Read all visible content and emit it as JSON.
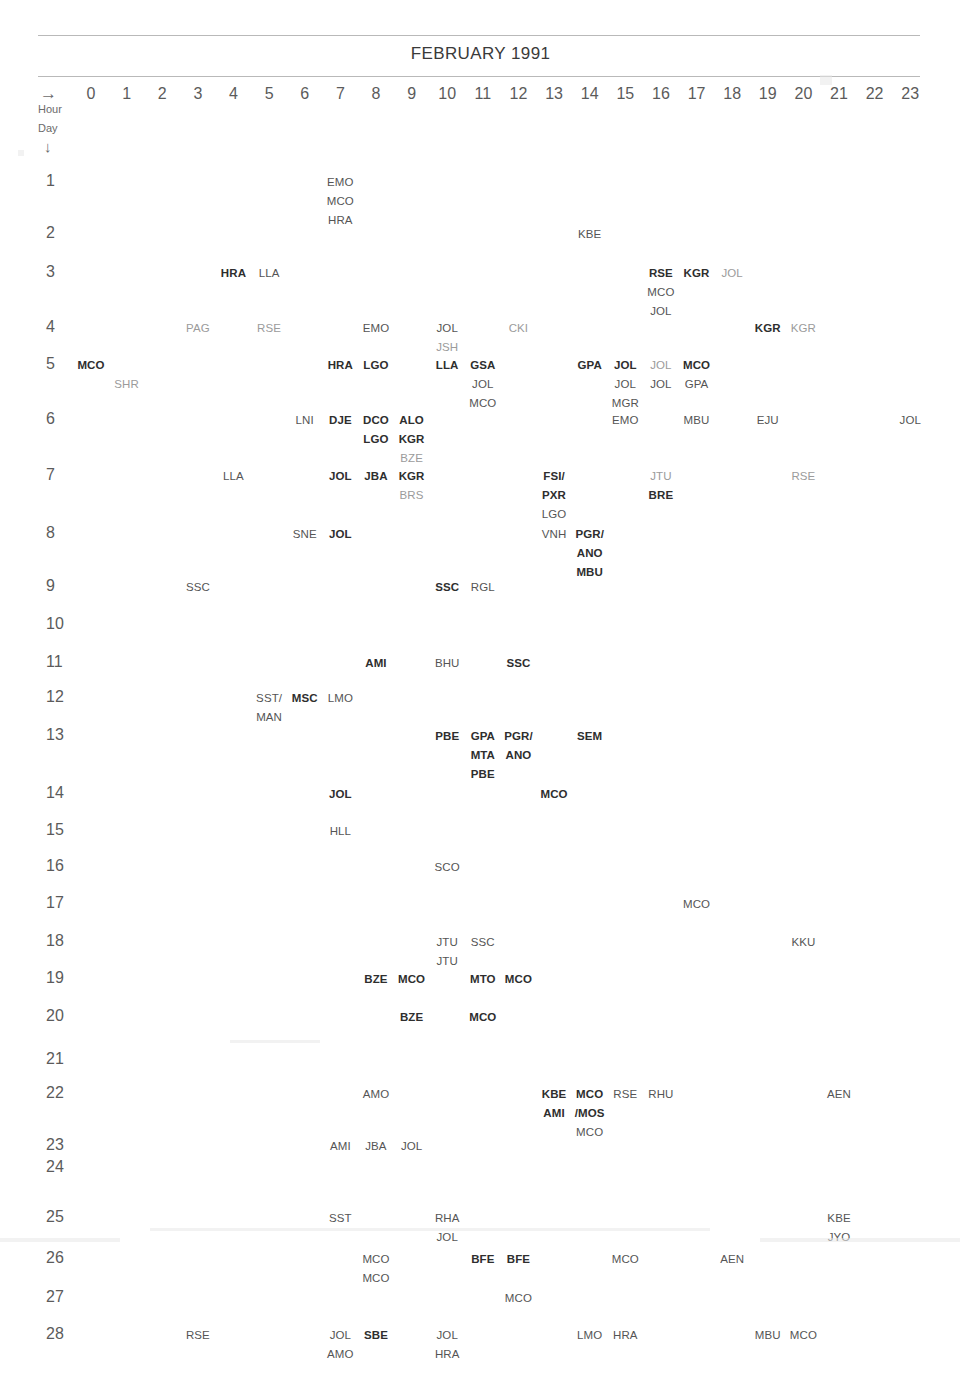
{
  "header": {
    "title": "FEBRUARY 1991",
    "hour_axis_label": "Hour",
    "day_axis_label": "Day",
    "hour_arrow": "→",
    "day_arrow": "↓",
    "hours": [
      "0",
      "1",
      "2",
      "3",
      "4",
      "5",
      "6",
      "7",
      "8",
      "9",
      "10",
      "11",
      "12",
      "13",
      "14",
      "15",
      "16",
      "17",
      "18",
      "19",
      "20",
      "21",
      "22",
      "23"
    ]
  },
  "colors": {
    "page_background": "#ffffff",
    "rule": "#b9b9b9",
    "text_dark": "#2e2e2e",
    "text_mid": "#555555",
    "text_light": "#9b9b9b",
    "axis_text": "#5b5b5b"
  },
  "chart_data": {
    "type": "table",
    "title": "FEBRUARY 1991",
    "xlabel": "Hour",
    "ylabel": "Day",
    "x": [
      0,
      1,
      2,
      3,
      4,
      5,
      6,
      7,
      8,
      9,
      10,
      11,
      12,
      13,
      14,
      15,
      16,
      17,
      18,
      19,
      20,
      21,
      22,
      23
    ],
    "xlim": [
      0,
      23
    ],
    "ylim": [
      1,
      28
    ],
    "grid": false,
    "legend": "none",
    "note": "Station-code event calendar: each day row lists three-letter codes placed at the hour column in which the event occurred; stacked codes indicate multiple events in the same hour.",
    "days": [
      {
        "day": "1",
        "entries": [
          {
            "hour": 7,
            "row": 0,
            "code": "EMO",
            "weight": "mid"
          },
          {
            "hour": 7,
            "row": 1,
            "code": "MCO",
            "weight": "mid"
          },
          {
            "hour": 7,
            "row": 2,
            "code": "HRA",
            "weight": "mid"
          }
        ]
      },
      {
        "day": "2",
        "entries": [
          {
            "hour": 14,
            "row": 0,
            "code": "KBE",
            "weight": "mid"
          }
        ]
      },
      {
        "day": "3",
        "entries": [
          {
            "hour": 4,
            "row": 0,
            "code": "HRA",
            "weight": "dark"
          },
          {
            "hour": 5,
            "row": 0,
            "code": "LLA",
            "weight": "mid"
          },
          {
            "hour": 16,
            "row": 0,
            "code": "RSE",
            "weight": "dark"
          },
          {
            "hour": 17,
            "row": 0,
            "code": "KGR",
            "weight": "dark"
          },
          {
            "hour": 18,
            "row": 0,
            "code": "JOL",
            "weight": "light"
          },
          {
            "hour": 16,
            "row": 1,
            "code": "MCO",
            "weight": "mid"
          },
          {
            "hour": 16,
            "row": 2,
            "code": "JOL",
            "weight": "mid"
          }
        ]
      },
      {
        "day": "4",
        "entries": [
          {
            "hour": 3,
            "row": 0,
            "code": "PAG",
            "weight": "light"
          },
          {
            "hour": 5,
            "row": 0,
            "code": "RSE",
            "weight": "light"
          },
          {
            "hour": 8,
            "row": 0,
            "code": "EMO",
            "weight": "mid"
          },
          {
            "hour": 10,
            "row": 0,
            "code": "JOL",
            "weight": "mid"
          },
          {
            "hour": 12,
            "row": 0,
            "code": "CKI",
            "weight": "light"
          },
          {
            "hour": 19,
            "row": 0,
            "code": "KGR",
            "weight": "dark"
          },
          {
            "hour": 20,
            "row": 0,
            "code": "KGR",
            "weight": "light"
          },
          {
            "hour": 10,
            "row": 1,
            "code": "JSH",
            "weight": "light"
          }
        ]
      },
      {
        "day": "5",
        "entries": [
          {
            "hour": 0,
            "row": 0,
            "code": "MCO",
            "weight": "dark"
          },
          {
            "hour": 7,
            "row": 0,
            "code": "HRA",
            "weight": "dark"
          },
          {
            "hour": 8,
            "row": 0,
            "code": "LGO",
            "weight": "dark"
          },
          {
            "hour": 10,
            "row": 0,
            "code": "LLA",
            "weight": "dark"
          },
          {
            "hour": 11,
            "row": 0,
            "code": "GSA",
            "weight": "dark"
          },
          {
            "hour": 14,
            "row": 0,
            "code": "GPA",
            "weight": "dark"
          },
          {
            "hour": 15,
            "row": 0,
            "code": "JOL",
            "weight": "dark"
          },
          {
            "hour": 16,
            "row": 0,
            "code": "JOL",
            "weight": "light"
          },
          {
            "hour": 17,
            "row": 0,
            "code": "MCO",
            "weight": "dark"
          },
          {
            "hour": 1,
            "row": 1,
            "code": "SHR",
            "weight": "light"
          },
          {
            "hour": 11,
            "row": 1,
            "code": "JOL",
            "weight": "mid"
          },
          {
            "hour": 15,
            "row": 1,
            "code": "JOL",
            "weight": "mid"
          },
          {
            "hour": 16,
            "row": 1,
            "code": "JOL",
            "weight": "mid"
          },
          {
            "hour": 17,
            "row": 1,
            "code": "GPA",
            "weight": "mid"
          },
          {
            "hour": 11,
            "row": 2,
            "code": "MCO",
            "weight": "mid"
          },
          {
            "hour": 15,
            "row": 2,
            "code": "MGR",
            "weight": "mid"
          }
        ]
      },
      {
        "day": "6",
        "entries": [
          {
            "hour": 6,
            "row": 0,
            "code": "LNI",
            "weight": "mid"
          },
          {
            "hour": 7,
            "row": 0,
            "code": "DJE",
            "weight": "dark"
          },
          {
            "hour": 8,
            "row": 0,
            "code": "DCO",
            "weight": "dark"
          },
          {
            "hour": 9,
            "row": 0,
            "code": "ALO",
            "weight": "dark"
          },
          {
            "hour": 15,
            "row": 0,
            "code": "EMO",
            "weight": "mid"
          },
          {
            "hour": 17,
            "row": 0,
            "code": "MBU",
            "weight": "mid"
          },
          {
            "hour": 19,
            "row": 0,
            "code": "EJU",
            "weight": "mid"
          },
          {
            "hour": 23,
            "row": 0,
            "code": "JOL",
            "weight": "mid"
          },
          {
            "hour": 8,
            "row": 1,
            "code": "LGO",
            "weight": "dark"
          },
          {
            "hour": 9,
            "row": 1,
            "code": "KGR",
            "weight": "dark"
          },
          {
            "hour": 9,
            "row": 2,
            "code": "BZE",
            "weight": "light"
          }
        ]
      },
      {
        "day": "7",
        "entries": [
          {
            "hour": 4,
            "row": 0,
            "code": "LLA",
            "weight": "mid"
          },
          {
            "hour": 7,
            "row": 0,
            "code": "JOL",
            "weight": "dark"
          },
          {
            "hour": 8,
            "row": 0,
            "code": "JBA",
            "weight": "dark"
          },
          {
            "hour": 9,
            "row": 0,
            "code": "KGR",
            "weight": "dark"
          },
          {
            "hour": 13,
            "row": 0,
            "code": "FSI/",
            "weight": "dark"
          },
          {
            "hour": 16,
            "row": 0,
            "code": "JTU",
            "weight": "light"
          },
          {
            "hour": 20,
            "row": 0,
            "code": "RSE",
            "weight": "light"
          },
          {
            "hour": 9,
            "row": 1,
            "code": "BRS",
            "weight": "light"
          },
          {
            "hour": 13,
            "row": 1,
            "code": "PXR",
            "weight": "dark"
          },
          {
            "hour": 16,
            "row": 1,
            "code": "BRE",
            "weight": "dark"
          },
          {
            "hour": 13,
            "row": 2,
            "code": "LGO",
            "weight": "mid"
          }
        ]
      },
      {
        "day": "8",
        "entries": [
          {
            "hour": 6,
            "row": 0,
            "code": "SNE",
            "weight": "mid"
          },
          {
            "hour": 7,
            "row": 0,
            "code": "JOL",
            "weight": "dark"
          },
          {
            "hour": 13,
            "row": 0,
            "code": "VNH",
            "weight": "mid"
          },
          {
            "hour": 14,
            "row": 0,
            "code": "PGR/",
            "weight": "dark"
          },
          {
            "hour": 14,
            "row": 1,
            "code": "ANO",
            "weight": "dark"
          },
          {
            "hour": 14,
            "row": 2,
            "code": "MBU",
            "weight": "dark"
          }
        ]
      },
      {
        "day": "9",
        "entries": [
          {
            "hour": 3,
            "row": 0,
            "code": "SSC",
            "weight": "mid"
          },
          {
            "hour": 10,
            "row": 0,
            "code": "SSC",
            "weight": "dark"
          },
          {
            "hour": 11,
            "row": 0,
            "code": "RGL",
            "weight": "mid"
          }
        ]
      },
      {
        "day": "10",
        "entries": []
      },
      {
        "day": "11",
        "entries": [
          {
            "hour": 8,
            "row": 0,
            "code": "AMI",
            "weight": "dark"
          },
          {
            "hour": 10,
            "row": 0,
            "code": "BHU",
            "weight": "mid"
          },
          {
            "hour": 12,
            "row": 0,
            "code": "SSC",
            "weight": "dark"
          }
        ]
      },
      {
        "day": "12",
        "entries": [
          {
            "hour": 5,
            "row": 0,
            "code": "SST/",
            "weight": "mid"
          },
          {
            "hour": 6,
            "row": 0,
            "code": "MSC",
            "weight": "dark"
          },
          {
            "hour": 7,
            "row": 0,
            "code": "LMO",
            "weight": "mid"
          },
          {
            "hour": 5,
            "row": 1,
            "code": "MAN",
            "weight": "mid"
          }
        ]
      },
      {
        "day": "13",
        "entries": [
          {
            "hour": 10,
            "row": 0,
            "code": "PBE",
            "weight": "dark"
          },
          {
            "hour": 11,
            "row": 0,
            "code": "GPA",
            "weight": "dark"
          },
          {
            "hour": 12,
            "row": 0,
            "code": "PGR/",
            "weight": "dark"
          },
          {
            "hour": 14,
            "row": 0,
            "code": "SEM",
            "weight": "dark"
          },
          {
            "hour": 11,
            "row": 1,
            "code": "MTA",
            "weight": "dark"
          },
          {
            "hour": 12,
            "row": 1,
            "code": "ANO",
            "weight": "dark"
          },
          {
            "hour": 11,
            "row": 2,
            "code": "PBE",
            "weight": "dark"
          }
        ]
      },
      {
        "day": "14",
        "entries": [
          {
            "hour": 7,
            "row": 0,
            "code": "JOL",
            "weight": "dark"
          },
          {
            "hour": 13,
            "row": 0,
            "code": "MCO",
            "weight": "dark"
          }
        ]
      },
      {
        "day": "15",
        "entries": [
          {
            "hour": 7,
            "row": 0,
            "code": "HLL",
            "weight": "mid"
          }
        ]
      },
      {
        "day": "16",
        "entries": [
          {
            "hour": 10,
            "row": 0,
            "code": "SCO",
            "weight": "mid"
          }
        ]
      },
      {
        "day": "17",
        "entries": [
          {
            "hour": 17,
            "row": 0,
            "code": "MCO",
            "weight": "mid"
          }
        ]
      },
      {
        "day": "18",
        "entries": [
          {
            "hour": 10,
            "row": 0,
            "code": "JTU",
            "weight": "mid"
          },
          {
            "hour": 11,
            "row": 0,
            "code": "SSC",
            "weight": "mid"
          },
          {
            "hour": 20,
            "row": 0,
            "code": "KKU",
            "weight": "mid"
          },
          {
            "hour": 10,
            "row": 1,
            "code": "JTU",
            "weight": "mid"
          }
        ]
      },
      {
        "day": "19",
        "entries": [
          {
            "hour": 8,
            "row": 0,
            "code": "BZE",
            "weight": "dark"
          },
          {
            "hour": 9,
            "row": 0,
            "code": "MCO",
            "weight": "dark"
          },
          {
            "hour": 11,
            "row": 0,
            "code": "MTO",
            "weight": "dark"
          },
          {
            "hour": 12,
            "row": 0,
            "code": "MCO",
            "weight": "dark"
          }
        ]
      },
      {
        "day": "20",
        "entries": [
          {
            "hour": 9,
            "row": 0,
            "code": "BZE",
            "weight": "dark"
          },
          {
            "hour": 11,
            "row": 0,
            "code": "MCO",
            "weight": "dark"
          }
        ]
      },
      {
        "day": "21",
        "entries": []
      },
      {
        "day": "22",
        "entries": [
          {
            "hour": 8,
            "row": 0,
            "code": "AMO",
            "weight": "mid"
          },
          {
            "hour": 13,
            "row": 0,
            "code": "KBE",
            "weight": "dark"
          },
          {
            "hour": 14,
            "row": 0,
            "code": "MCO",
            "weight": "dark"
          },
          {
            "hour": 15,
            "row": 0,
            "code": "RSE",
            "weight": "mid"
          },
          {
            "hour": 16,
            "row": 0,
            "code": "RHU",
            "weight": "mid"
          },
          {
            "hour": 21,
            "row": 0,
            "code": "AEN",
            "weight": "mid"
          },
          {
            "hour": 13,
            "row": 1,
            "code": "AMI",
            "weight": "dark"
          },
          {
            "hour": 14,
            "row": 1,
            "code": "/MOS",
            "weight": "dark"
          },
          {
            "hour": 14,
            "row": 2,
            "code": "MCO",
            "weight": "mid"
          }
        ]
      },
      {
        "day": "23",
        "entries": [
          {
            "hour": 7,
            "row": 0,
            "code": "AMI",
            "weight": "mid"
          },
          {
            "hour": 8,
            "row": 0,
            "code": "JBA",
            "weight": "mid"
          },
          {
            "hour": 9,
            "row": 0,
            "code": "JOL",
            "weight": "mid"
          }
        ]
      },
      {
        "day": "24",
        "entries": []
      },
      {
        "day": "25",
        "entries": [
          {
            "hour": 7,
            "row": 0,
            "code": "SST",
            "weight": "mid"
          },
          {
            "hour": 10,
            "row": 0,
            "code": "RHA",
            "weight": "mid"
          },
          {
            "hour": 21,
            "row": 0,
            "code": "KBE",
            "weight": "mid"
          },
          {
            "hour": 10,
            "row": 1,
            "code": "JOL",
            "weight": "mid"
          },
          {
            "hour": 21,
            "row": 1,
            "code": "JYO",
            "weight": "mid"
          }
        ]
      },
      {
        "day": "26",
        "entries": [
          {
            "hour": 8,
            "row": 0,
            "code": "MCO",
            "weight": "mid"
          },
          {
            "hour": 11,
            "row": 0,
            "code": "BFE",
            "weight": "dark"
          },
          {
            "hour": 12,
            "row": 0,
            "code": "BFE",
            "weight": "dark"
          },
          {
            "hour": 15,
            "row": 0,
            "code": "MCO",
            "weight": "mid"
          },
          {
            "hour": 18,
            "row": 0,
            "code": "AEN",
            "weight": "mid"
          },
          {
            "hour": 8,
            "row": 1,
            "code": "MCO",
            "weight": "mid"
          }
        ]
      },
      {
        "day": "27",
        "entries": [
          {
            "hour": 12,
            "row": 0,
            "code": "MCO",
            "weight": "mid"
          }
        ]
      },
      {
        "day": "28",
        "entries": [
          {
            "hour": 3,
            "row": 0,
            "code": "RSE",
            "weight": "mid"
          },
          {
            "hour": 7,
            "row": 0,
            "code": "JOL",
            "weight": "mid"
          },
          {
            "hour": 8,
            "row": 0,
            "code": "SBE",
            "weight": "dark"
          },
          {
            "hour": 10,
            "row": 0,
            "code": "JOL",
            "weight": "mid"
          },
          {
            "hour": 14,
            "row": 0,
            "code": "LMO",
            "weight": "mid"
          },
          {
            "hour": 15,
            "row": 0,
            "code": "HRA",
            "weight": "mid"
          },
          {
            "hour": 19,
            "row": 0,
            "code": "MBU",
            "weight": "mid"
          },
          {
            "hour": 20,
            "row": 0,
            "code": "MCO",
            "weight": "mid"
          },
          {
            "hour": 7,
            "row": 1,
            "code": "AMO",
            "weight": "mid"
          },
          {
            "hour": 10,
            "row": 1,
            "code": "HRA",
            "weight": "mid"
          }
        ]
      }
    ]
  }
}
